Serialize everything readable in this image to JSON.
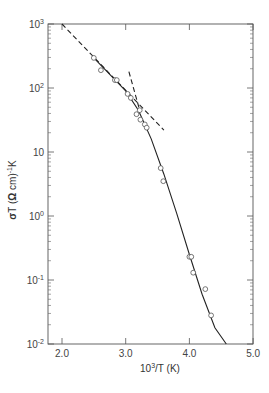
{
  "chart_data": {
    "type": "scatter",
    "title": "",
    "xlabel": "10³/T (K)",
    "ylabel": "σT (Ω cm)⁻¹K",
    "xlim": [
      1.78,
      5.0
    ],
    "ylim": [
      0.01,
      1000
    ],
    "yscale": "log",
    "x_ticks": [
      "2.0",
      "3.0",
      "4.0",
      "5.0"
    ],
    "y_ticks": [
      "10³",
      "10²",
      "10",
      "10⁰",
      "10⁻¹",
      "10⁻²"
    ],
    "grid": false,
    "legend": null,
    "series": [
      {
        "name": "data",
        "style": "open-circle",
        "x": [
          2.5,
          2.61,
          2.83,
          2.86,
          3.03,
          3.08,
          3.17,
          3.22,
          3.23,
          3.3,
          3.33,
          3.55,
          3.59,
          4.0,
          4.03,
          4.06,
          4.25,
          4.34
        ],
        "y": [
          295,
          190,
          133,
          133,
          81,
          70,
          39,
          45,
          32,
          27,
          24,
          5.6,
          3.5,
          0.23,
          0.23,
          0.13,
          0.072,
          0.028
        ]
      },
      {
        "name": "fit-solid",
        "style": "solid-line",
        "x": [
          2.5,
          3.0,
          3.2,
          3.4,
          3.6,
          3.8,
          4.0,
          4.2,
          4.4,
          4.58
        ],
        "y": [
          295,
          90,
          45,
          16,
          4.5,
          1.1,
          0.25,
          0.06,
          0.018,
          0.01
        ]
      },
      {
        "name": "asymptote-high-T",
        "style": "dashed-line",
        "x": [
          2.0,
          3.6
        ],
        "y": [
          1000,
          22
        ]
      },
      {
        "name": "asymptote-low-T",
        "style": "dashed-line",
        "x": [
          3.05,
          3.22
        ],
        "y": [
          180,
          45
        ]
      }
    ]
  },
  "axes": {
    "xlabel": "10³/T (K)",
    "ylabel": "σT (Ω cm)⁻¹K",
    "x_ticks": [
      {
        "v": 2.0,
        "label": "2.0"
      },
      {
        "v": 3.0,
        "label": "3.0"
      },
      {
        "v": 4.0,
        "label": "4.0"
      },
      {
        "v": 5.0,
        "label": "5.0"
      }
    ],
    "y_ticks": [
      {
        "v": 3,
        "base": "10",
        "exp": "3"
      },
      {
        "v": 2,
        "base": "10",
        "exp": "2"
      },
      {
        "v": 1,
        "base": "10",
        "exp": ""
      },
      {
        "v": 0,
        "base": "10",
        "exp": "0"
      },
      {
        "v": -1,
        "base": "10",
        "exp": "-1"
      },
      {
        "v": -2,
        "base": "10",
        "exp": "-2"
      }
    ]
  }
}
